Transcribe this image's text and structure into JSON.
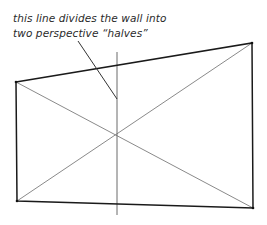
{
  "annotation": {
    "line1": "this line divides the wall into",
    "line2": "two perspective “halves”"
  },
  "diagram": {
    "colors": {
      "outline": "#1a1a1a",
      "diagonal": "#8a8a8a",
      "divider": "#6a6a6a",
      "pointer": "#333333"
    },
    "wall_corners": {
      "top_left": [
        16,
        82
      ],
      "top_right": [
        252,
        43
      ],
      "bottom_right": [
        253,
        208
      ],
      "bottom_left": [
        17,
        201
      ]
    },
    "diagonal_intersection": [
      117,
      135
    ],
    "divider_line": {
      "x": 117,
      "y1": 52,
      "y2": 215
    },
    "pointer_line": {
      "from": [
        78,
        41
      ],
      "to": [
        117,
        99
      ]
    }
  }
}
